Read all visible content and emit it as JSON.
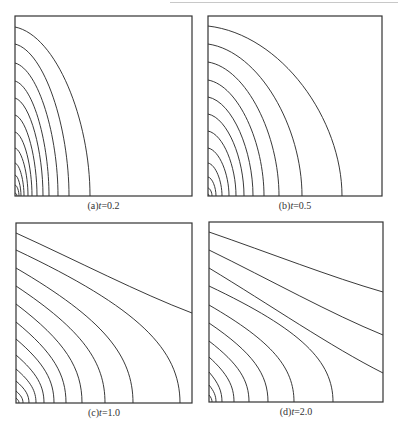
{
  "figure": {
    "panels": [
      {
        "id": "a",
        "label": "(a)",
        "var": "t",
        "eq": "=0.2",
        "caption_text": "(a)t=0.2"
      },
      {
        "id": "b",
        "label": "(b)",
        "var": "t",
        "eq": "=0.5",
        "caption_text": "(b)t=0.5"
      },
      {
        "id": "c",
        "label": "(c)",
        "var": "t",
        "eq": "=1.0",
        "caption_text": "(c)t=1.0"
      },
      {
        "id": "d",
        "label": "(d)",
        "var": "t",
        "eq": "=2.0",
        "caption_text": "(d)t=2.0"
      }
    ]
  },
  "chart_data": [
    {
      "type": "contour",
      "title": "(a) t=0.2",
      "t": 0.2,
      "frame": {
        "x": 15,
        "y": 16,
        "w": 177,
        "h": 180
      },
      "line_color": "#222222",
      "contours": [
        {
          "left_y": 27,
          "bottom_x": 90,
          "end": "bottom"
        },
        {
          "left_y": 44,
          "bottom_x": 69,
          "end": "bottom"
        },
        {
          "left_y": 63,
          "bottom_x": 58,
          "end": "bottom"
        },
        {
          "left_y": 81,
          "bottom_x": 49,
          "end": "bottom"
        },
        {
          "left_y": 98,
          "bottom_x": 43,
          "end": "bottom"
        },
        {
          "left_y": 115,
          "bottom_x": 37,
          "end": "bottom"
        },
        {
          "left_y": 132,
          "bottom_x": 32,
          "end": "bottom"
        },
        {
          "left_y": 148,
          "bottom_x": 28,
          "end": "bottom"
        },
        {
          "left_y": 163,
          "bottom_x": 24,
          "end": "bottom"
        },
        {
          "left_y": 175,
          "bottom_x": 21,
          "end": "bottom"
        },
        {
          "left_y": 185,
          "bottom_x": 19,
          "end": "bottom"
        },
        {
          "left_y": 193,
          "bottom_x": 17,
          "end": "bottom"
        }
      ]
    },
    {
      "type": "contour",
      "title": "(b) t=0.5",
      "t": 0.5,
      "frame": {
        "x": 208,
        "y": 16,
        "w": 174,
        "h": 180
      },
      "line_color": "#222222",
      "contours": [
        {
          "left_y": 26,
          "bottom_x": 342,
          "end": "bottom"
        },
        {
          "left_y": 44,
          "bottom_x": 302,
          "end": "bottom"
        },
        {
          "left_y": 62,
          "bottom_x": 279,
          "end": "bottom"
        },
        {
          "left_y": 80,
          "bottom_x": 264,
          "end": "bottom"
        },
        {
          "left_y": 97,
          "bottom_x": 253,
          "end": "bottom"
        },
        {
          "left_y": 114,
          "bottom_x": 244,
          "end": "bottom"
        },
        {
          "left_y": 131,
          "bottom_x": 236,
          "end": "bottom"
        },
        {
          "left_y": 148,
          "bottom_x": 229,
          "end": "bottom"
        },
        {
          "left_y": 163,
          "bottom_x": 222,
          "end": "bottom"
        },
        {
          "left_y": 177,
          "bottom_x": 216,
          "end": "bottom"
        },
        {
          "left_y": 188,
          "bottom_x": 212,
          "end": "bottom"
        },
        {
          "left_y": 194,
          "bottom_x": 209,
          "end": "bottom"
        }
      ]
    },
    {
      "type": "contour",
      "title": "(c) t=1.0",
      "t": 1.0,
      "frame": {
        "x": 16,
        "y": 223,
        "w": 176,
        "h": 180
      },
      "line_color": "#222222",
      "contours": [
        {
          "left_y": 233,
          "right_y": 313,
          "end": "right"
        },
        {
          "left_y": 250,
          "bottom_x": 180,
          "end": "bottom"
        },
        {
          "left_y": 268,
          "bottom_x": 133,
          "end": "bottom"
        },
        {
          "left_y": 286,
          "bottom_x": 105,
          "end": "bottom"
        },
        {
          "left_y": 304,
          "bottom_x": 82,
          "end": "bottom"
        },
        {
          "left_y": 322,
          "bottom_x": 66,
          "end": "bottom"
        },
        {
          "left_y": 339,
          "bottom_x": 54,
          "end": "bottom"
        },
        {
          "left_y": 355,
          "bottom_x": 44,
          "end": "bottom"
        },
        {
          "left_y": 369,
          "bottom_x": 36,
          "end": "bottom"
        },
        {
          "left_y": 381,
          "bottom_x": 29,
          "end": "bottom"
        },
        {
          "left_y": 391,
          "bottom_x": 23,
          "end": "bottom"
        },
        {
          "left_y": 398,
          "bottom_x": 19,
          "end": "bottom"
        }
      ]
    },
    {
      "type": "contour",
      "title": "(d) t=2.0",
      "t": 2.0,
      "frame": {
        "x": 209,
        "y": 222,
        "w": 174,
        "h": 180
      },
      "line_color": "#222222",
      "contours": [
        {
          "left_y": 232,
          "right_y": 292,
          "end": "right"
        },
        {
          "left_y": 250,
          "right_y": 335,
          "end": "right"
        },
        {
          "left_y": 268,
          "right_y": 373,
          "end": "right"
        },
        {
          "left_y": 286,
          "bottom_x": 333,
          "end": "bottom"
        },
        {
          "left_y": 305,
          "bottom_x": 294,
          "end": "bottom"
        },
        {
          "left_y": 323,
          "bottom_x": 268,
          "end": "bottom"
        },
        {
          "left_y": 341,
          "bottom_x": 249,
          "end": "bottom"
        },
        {
          "left_y": 357,
          "bottom_x": 234,
          "end": "bottom"
        },
        {
          "left_y": 372,
          "bottom_x": 222,
          "end": "bottom"
        },
        {
          "left_y": 385,
          "bottom_x": 216,
          "end": "bottom"
        },
        {
          "left_y": 395,
          "bottom_x": 212,
          "end": "bottom"
        }
      ]
    }
  ]
}
